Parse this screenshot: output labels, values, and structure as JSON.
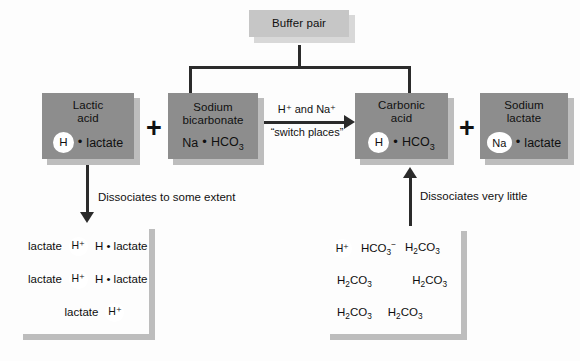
{
  "diagram": {
    "colors": {
      "background": "#fdfdfd",
      "box_medium": "#8d8d8d",
      "box_light": "#c6c6c6",
      "box_dark": "#5c5c5c",
      "shadow": "#bdbdbd",
      "line": "#2b2b2b",
      "circle": "#ffffff",
      "text": "#101010"
    },
    "buffer_pair": {
      "label": "Buffer pair"
    },
    "reactants": {
      "lactic_acid": {
        "name_line1": "Lactic",
        "name_line2": "acid",
        "circle_token": "H",
        "dot": "•",
        "formula_rest": "lactate"
      },
      "plus_1": "+",
      "sodium_bicarbonate": {
        "name_line1": "Sodium",
        "name_line2": "bicarbonate",
        "formula_left": "Na",
        "dot": "•",
        "formula_right_main": "HCO",
        "formula_right_sub": "3"
      }
    },
    "reaction_arrow": {
      "line1": "H⁺ and Na⁺",
      "line2": "“switch places”"
    },
    "products": {
      "carbonic_acid": {
        "name_line1": "Carbonic",
        "name_line2": "acid",
        "circle_token": "H",
        "dot": "•",
        "formula_main": "HCO",
        "formula_sub": "3"
      },
      "plus_2": "+",
      "sodium_lactate": {
        "name_line1": "Sodium",
        "name_line2": "lactate",
        "circle_token": "Na",
        "dot": "•",
        "formula_rest": "lactate"
      }
    },
    "dissociation_left": {
      "caption": "Dissociates to some extent",
      "rows": [
        {
          "lbl_left": "lactate",
          "circle": "H⁺",
          "tail": "H • lactate"
        },
        {
          "lbl_left": "lactate",
          "circle": "H⁺",
          "tail": "H • lactate"
        },
        {
          "lbl_left": "lactate",
          "circle": "H⁺",
          "tail": ""
        }
      ]
    },
    "dissociation_right": {
      "caption": "Dissociates very little",
      "row1": {
        "circle": "H⁺",
        "item2_main": "HCO",
        "item2_sub": "3",
        "item2_sup": "−",
        "item3_pre": "H",
        "item3_sub1": "2",
        "item3_mid": "CO",
        "item3_sub2": "3"
      },
      "molecules": [
        {
          "pre": "H",
          "sub1": "2",
          "mid": "CO",
          "sub2": "3"
        },
        {
          "pre": "H",
          "sub1": "2",
          "mid": "CO",
          "sub2": "3"
        },
        {
          "pre": "H",
          "sub1": "2",
          "mid": "CO",
          "sub2": "3"
        },
        {
          "pre": "H",
          "sub1": "2",
          "mid": "CO",
          "sub2": "3"
        }
      ]
    }
  }
}
